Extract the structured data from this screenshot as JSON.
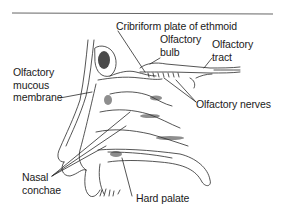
{
  "figure": {
    "colors": {
      "line": "#2a2a2a",
      "rule": "#555555",
      "text": "#1a1a1a",
      "background": "#ffffff"
    },
    "labels": {
      "cribriform": "Cribriform plate of ethmoid",
      "bulb": [
        "Olfactory",
        "bulb"
      ],
      "tract": [
        "Olfactory",
        "tract"
      ],
      "mucous": [
        "Olfactory",
        "mucous",
        "membrane"
      ],
      "nerves": "Olfactory nerves",
      "conchae": [
        "Nasal",
        "conchae"
      ],
      "palate": "Hard palate"
    }
  }
}
